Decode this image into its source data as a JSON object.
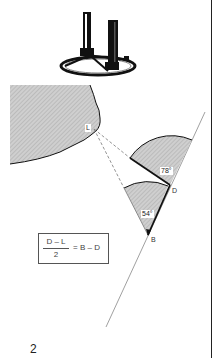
{
  "page": {
    "top_text_fragment": "~ ~ ~ ~ ~ ~ ~ ~ ~ ~",
    "page_number": "2"
  },
  "illustration": {
    "instrument": "surveying-instrument-on-circular-base"
  },
  "diagram": {
    "points": {
      "L": "L",
      "D": "D",
      "B": "B"
    },
    "angles": {
      "upper": "78°",
      "lower": "54°"
    },
    "formula": {
      "numerator": "D – L",
      "denominator": "2",
      "rhs": "= B – D"
    },
    "colors": {
      "shade": "#c8c8c8",
      "line": "#1a1a1a",
      "dashed": "#777777"
    }
  }
}
